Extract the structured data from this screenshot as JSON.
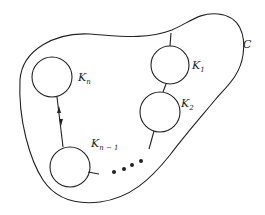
{
  "diagram": {
    "region_label": "C",
    "components": [
      {
        "id": "K1",
        "main": "K",
        "sub": "1"
      },
      {
        "id": "K2",
        "main": "K",
        "sub": "2"
      },
      {
        "id": "Kn-1",
        "main": "K",
        "sub": "n − 1"
      },
      {
        "id": "Kn",
        "main": "K",
        "sub": "n"
      }
    ],
    "ellipsis": "• • • •",
    "colors": {
      "stroke": "#222222",
      "background": "#ffffff"
    }
  }
}
